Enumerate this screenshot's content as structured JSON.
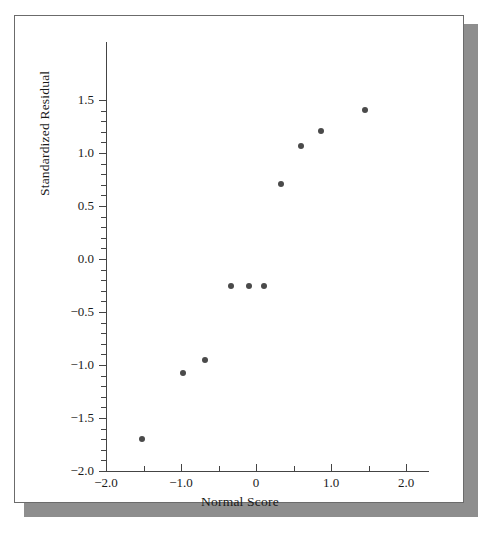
{
  "figure": {
    "background_color": "#ffffff",
    "frame_border_color": "#6b6b6b",
    "shadow_color": "#8e8e8e",
    "point_color": "#4a4a4a",
    "axis_color": "#444444"
  },
  "chart_data": {
    "type": "scatter",
    "title": "",
    "xlabel": "Normal Score",
    "ylabel": "Standardized Residual",
    "xlim": [
      -2.0,
      2.3
    ],
    "ylim": [
      -2.0,
      1.65
    ],
    "grid": false,
    "legend": null,
    "x_ticks_major": [
      -2.0,
      -1.0,
      0,
      1.0,
      2.0
    ],
    "x_tick_labels": [
      "-2.0",
      "-1.0",
      "0",
      "1.0",
      "2.0"
    ],
    "x_ticks_minor": [
      -1.5,
      -0.5,
      0.5,
      1.5
    ],
    "y_ticks_major": [
      1.5,
      1.0,
      0.5,
      0.0,
      -0.5,
      -1.0,
      -1.5,
      -2.0
    ],
    "y_tick_labels": [
      "1.5",
      "1.0",
      "0.5",
      "0.0",
      "-0.5",
      "-1.0",
      "-1.5",
      "-2.0"
    ],
    "y_ticks_minor": [
      1.4,
      1.3,
      1.2,
      1.1,
      0.9,
      0.8,
      0.7,
      0.6,
      0.4,
      0.3,
      0.2,
      0.1,
      -0.1,
      -0.2,
      -0.3,
      -0.4,
      -0.6,
      -0.7,
      -0.8,
      -0.9,
      -1.1,
      -1.2,
      -1.3,
      -1.4,
      -1.6,
      -1.7,
      -1.8,
      -1.9
    ],
    "x": [
      -1.52,
      -0.98,
      -0.68,
      -0.34,
      -0.1,
      0.1,
      0.33,
      0.6,
      0.86,
      1.45
    ],
    "y": [
      -1.7,
      -1.08,
      -0.95,
      -0.25,
      -0.25,
      -0.25,
      0.71,
      1.07,
      1.21,
      1.41
    ],
    "points": [
      {
        "x": -1.52,
        "y": -1.7
      },
      {
        "x": -0.98,
        "y": -1.08
      },
      {
        "x": -0.68,
        "y": -0.95
      },
      {
        "x": -0.34,
        "y": -0.25
      },
      {
        "x": -0.1,
        "y": -0.25
      },
      {
        "x": 0.1,
        "y": -0.25
      },
      {
        "x": 0.33,
        "y": 0.71
      },
      {
        "x": 0.6,
        "y": 1.07
      },
      {
        "x": 0.86,
        "y": 1.21
      },
      {
        "x": 1.45,
        "y": 1.41
      }
    ]
  }
}
